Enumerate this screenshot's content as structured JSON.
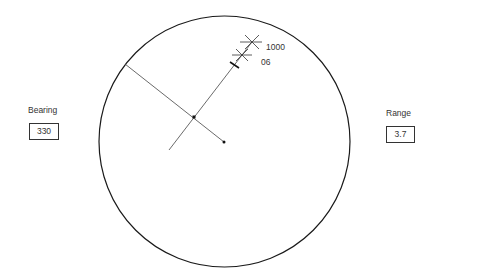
{
  "bearing": {
    "label": "Bearing",
    "value": "330"
  },
  "range": {
    "label": "Range",
    "value": "3.7"
  },
  "scope": {
    "center": [
      224,
      142
    ],
    "radius": 125.5,
    "markers": [
      {
        "label": "1000",
        "pos": [
          252,
          42
        ]
      },
      {
        "label": "06",
        "pos": [
          242,
          55
        ]
      }
    ]
  },
  "colors": {
    "line": "#222222",
    "background": "#ffffff"
  }
}
